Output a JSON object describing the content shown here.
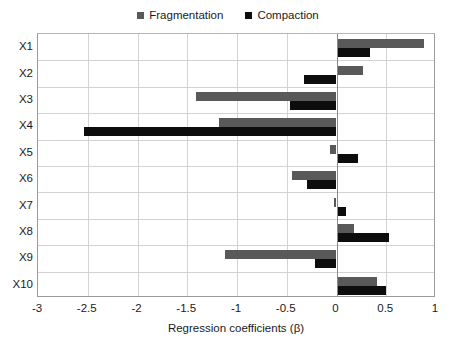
{
  "chart_data": {
    "type": "bar",
    "orientation": "horizontal",
    "title": "",
    "xlabel": "Regression coefficients (β)",
    "ylabel": "",
    "xlim": [
      -3,
      1
    ],
    "xticks": [
      -3,
      -2.5,
      -2,
      -1.5,
      -1,
      -0.5,
      0,
      0.5,
      1
    ],
    "xticklabels": [
      "-3",
      "-2.5",
      "-2",
      "-1.5",
      "-1",
      "-0.5",
      "0",
      "0.5",
      "1"
    ],
    "categories": [
      "X1",
      "X2",
      "X3",
      "X4",
      "X5",
      "X6",
      "X7",
      "X8",
      "X9",
      "X10"
    ],
    "grid": true,
    "legend_position": "top-center",
    "series": [
      {
        "name": "Fragmentation",
        "color": "#595959",
        "values": [
          0.88,
          0.27,
          -1.41,
          -1.18,
          -0.07,
          -0.45,
          -0.03,
          0.18,
          -1.12,
          0.41
        ]
      },
      {
        "name": "Compaction",
        "color": "#0d0d0d",
        "values": [
          0.34,
          -0.33,
          -0.47,
          -2.54,
          0.22,
          -0.3,
          0.1,
          0.53,
          -0.22,
          0.5
        ]
      }
    ]
  },
  "legend": {
    "items": [
      {
        "label": "Fragmentation",
        "color": "#595959"
      },
      {
        "label": "Compaction",
        "color": "#0d0d0d"
      }
    ]
  },
  "axes": {
    "x_title": "Regression coefficients (β)"
  }
}
